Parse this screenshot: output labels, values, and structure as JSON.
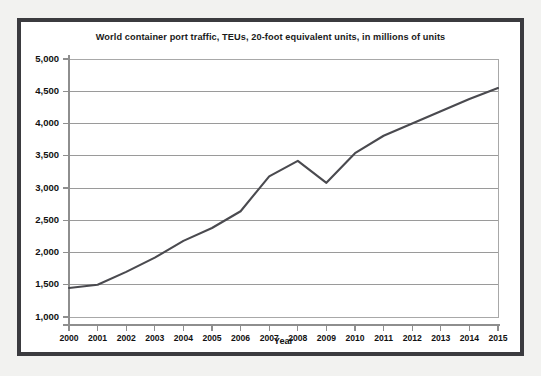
{
  "figure": {
    "title": "World container port traffic, TEUs, 20-foot equivalent units, in millions of units",
    "frame_color": "#3b3b3f",
    "background_color": "#ffffff",
    "outer_background_color": "#f2f2f0"
  },
  "chart_data": {
    "type": "line",
    "title": "World container port traffic, TEUs, 20-foot equivalent units, in millions of units",
    "xlabel": "Year",
    "ylabel": "",
    "categories": [
      "2000",
      "2001",
      "2002",
      "2003",
      "2004",
      "2005",
      "2006",
      "2007",
      "2008",
      "2009",
      "2010",
      "2011",
      "2012",
      "2013",
      "2014",
      "2015"
    ],
    "x": [
      2000,
      2001,
      2002,
      2003,
      2004,
      2005,
      2006,
      2007,
      2008,
      2009,
      2010,
      2011,
      2012,
      2013,
      2014,
      2015
    ],
    "values": [
      1450,
      1500,
      1700,
      1920,
      2180,
      2380,
      2640,
      3180,
      3420,
      3080,
      3540,
      3810,
      4000,
      4190,
      4380,
      4550
    ],
    "series": [
      {
        "name": "World container port traffic",
        "color": "#4a4a4f",
        "values": [
          1450,
          1500,
          1700,
          1920,
          2180,
          2380,
          2640,
          3180,
          3420,
          3080,
          3540,
          3810,
          4000,
          4190,
          4380,
          4550
        ]
      }
    ],
    "ylim": [
      1000,
      5000
    ],
    "xlim": [
      2000,
      2015
    ],
    "ytick_values": [
      1000,
      1500,
      2000,
      2500,
      3000,
      3500,
      4000,
      4500,
      5000
    ],
    "ytick_labels": [
      "1,000",
      "1,500",
      "2,000",
      "2,500",
      "3,000",
      "3,500",
      "4,000",
      "4,500",
      "5,000"
    ],
    "xtick_labels": [
      "2000",
      "2001",
      "2002",
      "2003",
      "2004",
      "2005",
      "2006",
      "2007",
      "2008",
      "2009",
      "2010",
      "2011",
      "2012",
      "2013",
      "2014",
      "2015"
    ],
    "grid": true,
    "grid_axis": "y",
    "grid_color": "#9a9a9a",
    "legend": false,
    "legend_position": "none",
    "line_color": "#4a4a4f",
    "line_width": 2.1,
    "markers": false
  }
}
